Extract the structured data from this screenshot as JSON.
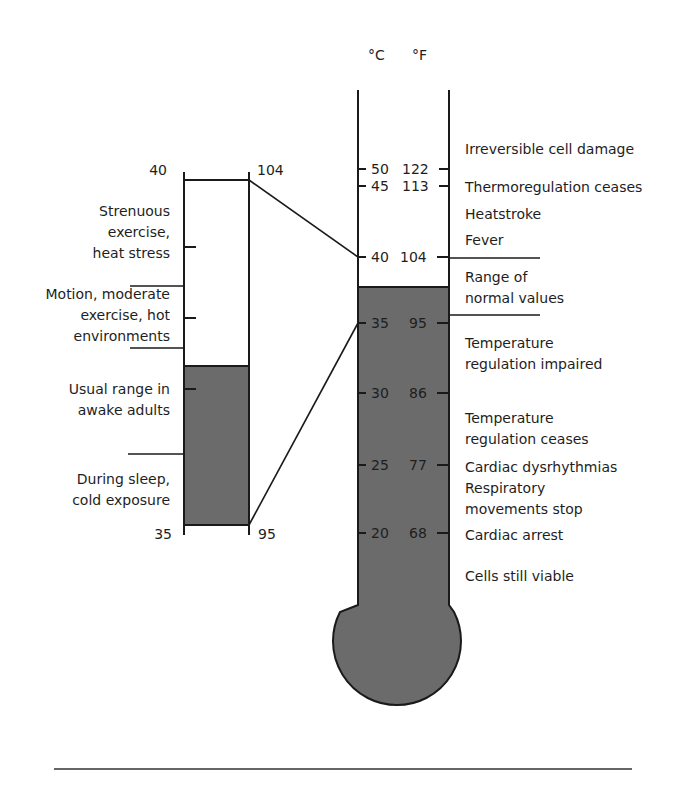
{
  "colors": {
    "fill": "#6b6b6b",
    "line": "#1a1a1a",
    "text": "#1e1e1e",
    "background": "#ffffff"
  },
  "main_thermometer": {
    "unit_c": "°C",
    "unit_f": "°F",
    "ticks": [
      {
        "c": "50",
        "f": "122"
      },
      {
        "c": "45",
        "f": "113"
      },
      {
        "c": "40",
        "f": "104"
      },
      {
        "c": "35",
        "f": "95"
      },
      {
        "c": "30",
        "f": "86"
      },
      {
        "c": "25",
        "f": "77"
      },
      {
        "c": "20",
        "f": "68"
      }
    ],
    "annotations": [
      {
        "lines": [
          "Irreversible cell damage"
        ]
      },
      {
        "lines": [
          "Thermoregulation ceases"
        ]
      },
      {
        "lines": [
          "Heatstroke"
        ]
      },
      {
        "lines": [
          "Fever"
        ]
      },
      {
        "lines": [
          "Range of",
          "normal values"
        ]
      },
      {
        "lines": [
          "Temperature",
          "regulation impaired"
        ]
      },
      {
        "lines": [
          "Temperature",
          "regulation ceases"
        ]
      },
      {
        "lines": [
          "Cardiac dysrhythmias"
        ]
      },
      {
        "lines": [
          "Respiratory",
          "movements stop"
        ]
      },
      {
        "lines": [
          "Cardiac arrest"
        ]
      },
      {
        "lines": [
          "Cells still viable"
        ]
      }
    ]
  },
  "normal_range_scale": {
    "top_c": "40",
    "top_f": "104",
    "bottom_c": "35",
    "bottom_f": "95",
    "annotations": [
      {
        "lines": [
          "Strenuous",
          "exercise,",
          "heat stress"
        ]
      },
      {
        "lines": [
          "Motion, moderate",
          "exercise, hot",
          "environments"
        ]
      },
      {
        "lines": [
          "Usual range in",
          "awake adults"
        ]
      },
      {
        "lines": [
          "During sleep,",
          "cold exposure"
        ]
      }
    ]
  }
}
